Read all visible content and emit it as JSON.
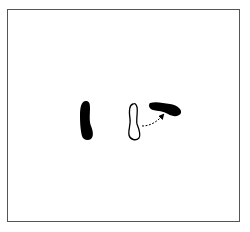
{
  "figure": {
    "colors": {
      "frame": "#555555",
      "fill": "#000000",
      "background": "#ffffff"
    },
    "shapes": [
      {
        "name": "solid-footprint-vertical",
        "style": "filled"
      },
      {
        "name": "outline-footprint-vertical",
        "style": "outline"
      },
      {
        "name": "solid-footprint-rotated",
        "style": "filled"
      }
    ],
    "arrow": {
      "style": "dashed",
      "direction": "up-right"
    }
  }
}
